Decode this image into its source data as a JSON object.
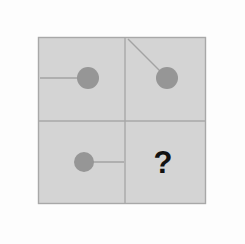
{
  "puzzle": {
    "kind": "matrix-reasoning-2x2",
    "background_color": "#fdfdfd",
    "panel": {
      "fill": "#d4d4d4",
      "border_color": "#a8a8a8",
      "x": 38,
      "y": 37,
      "width": 168,
      "height": 167
    },
    "divider": {
      "color": "#a8a8a8",
      "vertical_x": 125,
      "horizontal_y": 121,
      "width": 1.4
    },
    "shape_style": {
      "circle_fill": "#969696",
      "line_color": "#a3a3a3",
      "line_width": 1.4,
      "radius": 11
    },
    "cells": [
      {
        "name": "top-left",
        "label": "A",
        "shape": "circle-with-line",
        "circle_cx": 88,
        "circle_cy": 78,
        "radius": 11,
        "line_x1": 40,
        "line_y1": 78,
        "line_x2": 88,
        "line_y2": 78,
        "pointer_direction": "west",
        "angle_degrees": 180
      },
      {
        "name": "top-right",
        "label": "B",
        "shape": "circle-with-line",
        "circle_cx": 167,
        "circle_cy": 78,
        "radius": 11,
        "line_x1": 128,
        "line_y1": 39,
        "line_x2": 167,
        "line_y2": 78,
        "pointer_direction": "northwest",
        "angle_degrees": 135
      },
      {
        "name": "bottom-left",
        "label": "C",
        "shape": "circle-with-line",
        "circle_cx": 84,
        "circle_cy": 162,
        "radius": 10,
        "line_x1": 84,
        "line_y1": 162,
        "line_x2": 124,
        "line_y2": 162,
        "pointer_direction": "east",
        "angle_degrees": 0
      },
      {
        "name": "bottom-right",
        "label": "D",
        "shape": "question-mark",
        "text": "?",
        "text_x": 163,
        "text_y": 173,
        "text_color": "#121212",
        "font_size": 31
      }
    ]
  }
}
